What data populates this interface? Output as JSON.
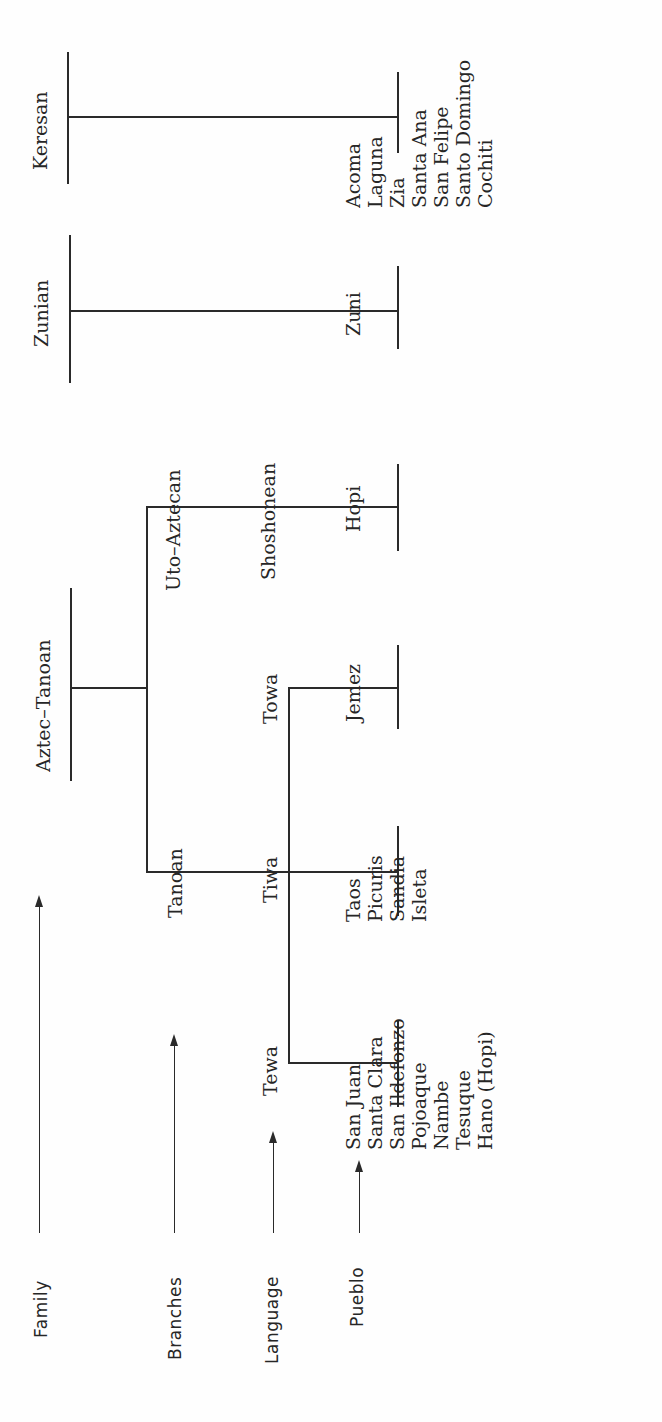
{
  "diagram": {
    "type": "tree",
    "orientation": "rotated-90-ccw",
    "levels": [
      {
        "id": "family",
        "label": "Family"
      },
      {
        "id": "branches",
        "label": "Branches"
      },
      {
        "id": "language",
        "label": "Language"
      },
      {
        "id": "pueblo",
        "label": "Pueblo"
      }
    ],
    "families": {
      "keresan": {
        "label": "Keresan"
      },
      "zunian": {
        "label": "Zunian"
      },
      "aztec_tanoan": {
        "label": "Aztec–Tanoan"
      }
    },
    "branches": {
      "uto_aztecan": {
        "label": "Uto–Aztecan"
      },
      "tanoan": {
        "label": "Tanoan"
      }
    },
    "languages": {
      "shoshonean": {
        "label": "Shoshonean"
      },
      "towa": {
        "label": "Towa"
      },
      "tiwa": {
        "label": "Tiwa"
      },
      "tewa": {
        "label": "Tewa"
      }
    },
    "pueblos": {
      "keresan": [
        "Acoma",
        "Laguna",
        "Zia",
        "Santa Ana",
        "San Felipe",
        "Santo Domingo",
        "Cochiti"
      ],
      "zunian": [
        "Zuni"
      ],
      "shoshonean": [
        "Hopi"
      ],
      "towa": [
        "Jemez"
      ],
      "tiwa": [
        "Taos",
        "Picuris",
        "Sandia",
        "Isleta"
      ],
      "tewa": [
        "San Juan",
        "Santa Clara",
        "San Ildefonzo",
        "Pojoaque",
        "Nambe",
        "Tesuque",
        "Hano (Hopi)"
      ]
    }
  },
  "colors": {
    "line": "#2a2a2a",
    "text": "#262626",
    "background": "#fefefe"
  }
}
